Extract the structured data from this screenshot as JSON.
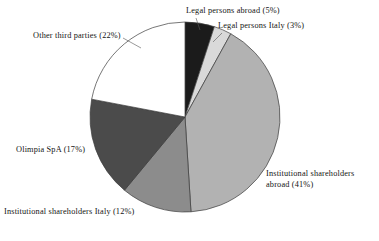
{
  "chart_data": {
    "type": "pie",
    "title": "",
    "subtitle": "",
    "xlabel": "",
    "ylabel": "",
    "legend_position": "none",
    "grid": false,
    "units": "percent",
    "start_angle_deg": 0,
    "direction": "clockwise",
    "categories": [
      "Legal persons abroad",
      "Legal persons Italy",
      "Institutional shareholders abroad",
      "Institutional shareholders Italy",
      "Olimpia SpA",
      "Other third parties"
    ],
    "values": [
      5,
      3,
      41,
      12,
      17,
      22
    ],
    "colors": [
      "#1b1b1b",
      "#d9d9d9",
      "#b2b2b2",
      "#8c8c8c",
      "#4b4b4b",
      "#ffffff"
    ],
    "slices": [
      {
        "label": "Legal persons abroad",
        "value": 5,
        "percent_text": "(5%)",
        "color": "#1b1b1b"
      },
      {
        "label": "Legal persons Italy",
        "value": 3,
        "percent_text": "(3%)",
        "color": "#d9d9d9"
      },
      {
        "label": "Institutional shareholders abroad",
        "value": 41,
        "percent_text": "(41%)",
        "color": "#b2b2b2"
      },
      {
        "label": "Institutional shareholders Italy",
        "value": 12,
        "percent_text": "(12%)",
        "color": "#8c8c8c"
      },
      {
        "label": "Olimpia SpA",
        "value": 17,
        "percent_text": "(17%)",
        "color": "#4b4b4b"
      },
      {
        "label": "Other third parties",
        "value": 22,
        "percent_text": "(22%)",
        "color": "#ffffff"
      }
    ]
  },
  "labels": {
    "legal_persons_abroad": "Legal persons abroad (5%)",
    "legal_persons_italy": "Legal persons Italy (3%)",
    "institutional_shareholders_abroad_line1": "Institutional shareholders",
    "institutional_shareholders_abroad_line2": "abroad (41%)",
    "institutional_shareholders_italy": "Institutional shareholders Italy (12%)",
    "olimpia_spa": "Olimpia SpA (17%)",
    "other_third_parties": "Other third parties (22%)"
  },
  "geometry": {
    "center_x": 185,
    "center_y": 117,
    "radius": 95,
    "stroke_color": "#3c3c3c",
    "stroke_width": 0.7
  }
}
